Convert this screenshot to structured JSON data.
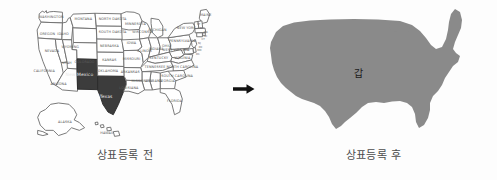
{
  "figure": {
    "colors": {
      "background": "#fdfdfd",
      "state_fill": "#ffffff",
      "state_stroke": "#6d6d6d",
      "highlight_fill": "#3c3c3c",
      "silhouette_fill": "#8a8a8a",
      "arrow": "#111111",
      "caption_text": "#4c4c4c"
    }
  },
  "panel_before": {
    "caption": "상표등록 전",
    "highlighted_states": [
      "New Mexico",
      "Texas"
    ],
    "state_labels": [
      {
        "name": "WASHINGTON",
        "x": 18.5,
        "y": 13.5
      },
      {
        "name": "OREGON",
        "x": 15.5,
        "y": 26.5
      },
      {
        "name": "IDAHO",
        "x": 27.5,
        "y": 27.0
      },
      {
        "name": "MONTANA",
        "x": 43.0,
        "y": 15.5
      },
      {
        "name": "NORTH DAKOTA",
        "x": 65.5,
        "y": 15.0
      },
      {
        "name": "MINNESOTA",
        "x": 83.0,
        "y": 19.0
      },
      {
        "name": "WYOMING",
        "x": 33.0,
        "y": 36.5
      },
      {
        "name": "SOUTH DAKOTA",
        "x": 65.5,
        "y": 25.5
      },
      {
        "name": "NEVADA",
        "x": 19.0,
        "y": 40.0
      },
      {
        "name": "UTAH",
        "x": 30.5,
        "y": 49.0
      },
      {
        "name": "COLORADO",
        "x": 44.0,
        "y": 48.0
      },
      {
        "name": "NEBRASKA",
        "x": 63.0,
        "y": 36.0
      },
      {
        "name": "IOWA",
        "x": 80.0,
        "y": 33.5
      },
      {
        "name": "WISCONSIN",
        "x": 88.5,
        "y": 25.0
      },
      {
        "name": "CALIFORNIA",
        "x": 13.0,
        "y": 55.0
      },
      {
        "name": "ARIZONA",
        "x": 24.0,
        "y": 65.0
      },
      {
        "name": "KANSAS",
        "x": 63.0,
        "y": 46.5
      },
      {
        "name": "MISSOURI",
        "x": 80.0,
        "y": 46.0
      },
      {
        "name": "ILLINOIS",
        "x": 90.0,
        "y": 40.0
      },
      {
        "name": "INDIANA",
        "x": 99.0,
        "y": 38.5
      },
      {
        "name": "OHIO",
        "x": 107.0,
        "y": 36.0
      },
      {
        "name": "MICHIGAN",
        "x": 100.0,
        "y": 24.0
      },
      {
        "name": "PENNSYLVANIA",
        "x": 119.0,
        "y": 32.0
      },
      {
        "name": "NEW YORK",
        "x": 122.0,
        "y": 22.0
      },
      {
        "name": "MAINE",
        "x": 137.0,
        "y": 12.5
      },
      {
        "name": "OKLAHOMA",
        "x": 62.0,
        "y": 55.5
      },
      {
        "name": "ARKANSAS",
        "x": 79.0,
        "y": 56.0
      },
      {
        "name": "KENTUCKY",
        "x": 101.0,
        "y": 45.5
      },
      {
        "name": "TENNESSEE",
        "x": 98.0,
        "y": 52.5
      },
      {
        "name": "WEST VIRGINIA",
        "x": 114.0,
        "y": 39.5
      },
      {
        "name": "VIRGINIA",
        "x": 119.0,
        "y": 45.0
      },
      {
        "name": "NORTH CAROLINA",
        "x": 119.0,
        "y": 52.0
      },
      {
        "name": "SOUTH CAROLINA",
        "x": 115.0,
        "y": 59.0
      },
      {
        "name": "LOUISIANA",
        "x": 78.0,
        "y": 68.5
      },
      {
        "name": "MISSISSIPPI",
        "x": 88.0,
        "y": 63.0
      },
      {
        "name": "ALABAMA",
        "x": 97.0,
        "y": 63.0
      },
      {
        "name": "GEORGIA",
        "x": 107.0,
        "y": 63.0
      },
      {
        "name": "FLORIDA",
        "x": 113.0,
        "y": 78.0
      },
      {
        "name": "ALASKA",
        "x": 29.0,
        "y": 94.0
      },
      {
        "name": "HAWAII",
        "x": 61.0,
        "y": 103.0
      }
    ],
    "small_state_labels": [
      {
        "name": "VT",
        "x": 131.5,
        "y": 19.0
      },
      {
        "name": "NH",
        "x": 134.0,
        "y": 22.0
      },
      {
        "name": "MA",
        "x": 137.0,
        "y": 25.0
      },
      {
        "name": "RI",
        "x": 137.0,
        "y": 28.0
      },
      {
        "name": "CT",
        "x": 135.0,
        "y": 30.5
      },
      {
        "name": "NJ",
        "x": 132.0,
        "y": 33.5
      },
      {
        "name": "DE",
        "x": 133.0,
        "y": 36.5
      },
      {
        "name": "MD",
        "x": 132.0,
        "y": 39.5
      },
      {
        "name": "DC",
        "x": 131.0,
        "y": 42.5
      }
    ],
    "highlight_labels": [
      {
        "name": "New Mexico",
        "x": 40.0,
        "y": 58.5
      },
      {
        "name": "Texas",
        "x": 60.5,
        "y": 75.0
      }
    ]
  },
  "panel_after": {
    "caption": "상표등록 후",
    "silhouette_label": "갑",
    "description": "solid gray silhouette of the contiguous United States"
  },
  "arrow": {
    "direction": "right",
    "icon": "arrow-right-icon"
  }
}
